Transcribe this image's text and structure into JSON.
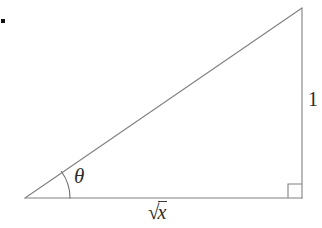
{
  "figure": {
    "kind": "right-triangle-trigonometry-diagram",
    "background_color": "#ffffff",
    "stroke_color": "#808080",
    "text_color": "#2b2b2b",
    "width": 322,
    "height": 228,
    "vertices": {
      "angle_vertex": [
        25,
        198
      ],
      "right_angle_vertex": [
        302,
        198
      ],
      "apex": [
        302,
        8
      ]
    },
    "labels": {
      "angle": "θ",
      "opposite_side": "1",
      "adjacent_side_radical": "√",
      "adjacent_side_radicand": "x",
      "adjacent_side_full": "√x"
    },
    "markers": {
      "right_angle_square_size": 14,
      "angle_arc_radius": 45,
      "bullet_dot": "▪"
    }
  }
}
